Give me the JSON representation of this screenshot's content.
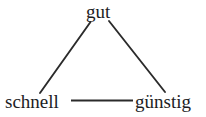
{
  "diagram": {
    "background_color": "#ffffff",
    "line_color": "#2b2b2b",
    "text_color": "#1d1d1f",
    "nodes": [
      {
        "id": "gut",
        "label": "gut",
        "position": "top"
      },
      {
        "id": "schnell",
        "label": "schnell",
        "position": "bottom-left"
      },
      {
        "id": "guenstig",
        "label": "günstig",
        "position": "bottom-right"
      }
    ],
    "edges": [
      {
        "id": "gut-schnell",
        "from": "gut",
        "to": "schnell",
        "style": "diagonal-left"
      },
      {
        "id": "gut-guenstig",
        "from": "gut",
        "to": "guenstig",
        "style": "diagonal-right"
      },
      {
        "id": "schnell-guenstig",
        "from": "schnell",
        "to": "guenstig",
        "style": "horizontal"
      }
    ]
  }
}
